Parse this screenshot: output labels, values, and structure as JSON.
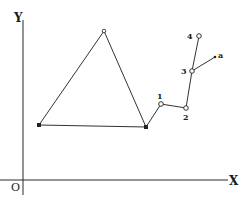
{
  "diagram": {
    "axes": {
      "x_label": "X",
      "y_label": "Y",
      "origin_label": "O"
    },
    "triangle": {
      "vertices": [
        {
          "name": "left",
          "x": 39,
          "y": 125,
          "marker": "filled"
        },
        {
          "name": "apex",
          "x": 104,
          "y": 31,
          "marker": "open"
        },
        {
          "name": "right",
          "x": 146,
          "y": 127,
          "marker": "filled"
        }
      ]
    },
    "chain": {
      "points": [
        {
          "label": "1",
          "x": 161,
          "y": 104
        },
        {
          "label": "2",
          "x": 186,
          "y": 108
        },
        {
          "label": "3",
          "x": 192,
          "y": 71
        },
        {
          "label": "4",
          "x": 199,
          "y": 36
        }
      ],
      "branch": {
        "label": "a",
        "from": "3",
        "x": 215,
        "y": 57
      }
    }
  }
}
